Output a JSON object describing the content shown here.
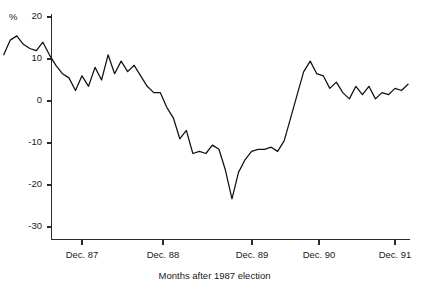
{
  "chart_data": {
    "type": "line",
    "title": "",
    "subtitle": "",
    "xlabel": "Months after 1987 election",
    "ylabel": "%",
    "unit_label": "%",
    "legend": [],
    "legend_position": "none",
    "grid": false,
    "axis": {
      "x_tick_labels": [
        "Dec. 87",
        "Dec. 88",
        "Dec. 89",
        "Dec. 90",
        "Dec. 91"
      ],
      "x_tick_months": [
        13,
        25,
        37,
        49,
        61
      ],
      "y_tick_labels": [
        "20",
        "10",
        "0",
        "-10",
        "-20",
        "-30"
      ],
      "y_tick_values": [
        20,
        10,
        0,
        -10,
        -20,
        -30
      ],
      "ylim": [
        -33,
        21
      ],
      "xlim": [
        0,
        64
      ]
    },
    "series": [
      {
        "name": "percent change",
        "color": "#111111",
        "x": [
          1,
          2,
          3,
          4,
          5,
          6,
          7,
          8,
          9,
          10,
          11,
          12,
          13,
          14,
          15,
          16,
          17,
          18,
          19,
          20,
          21,
          22,
          23,
          24,
          25,
          26,
          27,
          28,
          29,
          30,
          31,
          32,
          33,
          34,
          35,
          36,
          37,
          38,
          39,
          40,
          41,
          42,
          43,
          44,
          45,
          46,
          47,
          48,
          49,
          50,
          51,
          52,
          53,
          54,
          55,
          56,
          57,
          58,
          59,
          60,
          61,
          62,
          63
        ],
        "values": [
          11.0,
          14.5,
          15.5,
          13.5,
          12.5,
          12.0,
          14.0,
          11.0,
          8.5,
          6.5,
          5.5,
          2.5,
          6.0,
          3.5,
          8.0,
          5.0,
          11.0,
          6.5,
          9.5,
          7.0,
          8.5,
          6.0,
          3.5,
          2.0,
          2.0,
          -1.5,
          -4.0,
          -9.0,
          -7.0,
          -12.5,
          -12.0,
          -12.5,
          -10.5,
          -11.5,
          -16.5,
          -23.3,
          -17.0,
          -14.0,
          -12.0,
          -11.5,
          -11.5,
          -11.0,
          -12.0,
          -9.5,
          -4.0,
          1.5,
          7.0,
          9.5,
          6.5,
          6.0,
          3.0,
          4.5,
          2.0,
          0.5,
          3.5,
          1.5,
          3.5,
          0.5,
          2.0,
          1.5,
          3.0,
          2.5,
          4.0
        ]
      }
    ]
  }
}
